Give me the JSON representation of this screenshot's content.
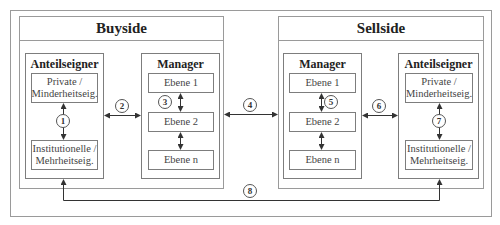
{
  "diagram": {
    "buyside": {
      "title": "Buyside",
      "shareholders": {
        "title": "Anteilseigner",
        "top_box": [
          "Private /",
          "Minderheitseig."
        ],
        "bottom_box": [
          "Institutionelle /",
          "Mehrheitseig."
        ]
      },
      "manager": {
        "title": "Manager",
        "levels": [
          "Ebene 1",
          "Ebene 2",
          "Ebene n"
        ]
      }
    },
    "sellside": {
      "title": "Sellside",
      "manager": {
        "title": "Manager",
        "levels": [
          "Ebene 1",
          "Ebene 2",
          "Ebene n"
        ]
      },
      "shareholders": {
        "title": "Anteilseigner",
        "top_box": [
          "Private /",
          "Minderheitseig."
        ],
        "bottom_box": [
          "Institutionelle /",
          "Mehrheitseig."
        ]
      }
    },
    "relations": [
      {
        "id": "1",
        "label": "1",
        "between": "Buyside Private/Minderheitseig. ↔ Institutionelle/Mehrheitseig."
      },
      {
        "id": "2",
        "label": "2",
        "between": "Buyside Anteilseigner ↔ Buyside Manager"
      },
      {
        "id": "3",
        "label": "3",
        "between": "Buyside Manager Ebene 1 ↔ Ebene 2 ↔ Ebene n"
      },
      {
        "id": "4",
        "label": "4",
        "between": "Buyside ↔ Sellside"
      },
      {
        "id": "5",
        "label": "5",
        "between": "Sellside Manager Ebene 1 ↔ Ebene 2 ↔ Ebene n"
      },
      {
        "id": "6",
        "label": "6",
        "between": "Sellside Manager ↔ Sellside Anteilseigner"
      },
      {
        "id": "7",
        "label": "7",
        "between": "Sellside Private/Minderheitseig. ↔ Institutionelle/Mehrheitseig."
      },
      {
        "id": "8",
        "label": "8",
        "between": "Buyside Anteilseigner ↔ Sellside Anteilseigner"
      }
    ],
    "colors": {
      "border": "#9a9a9a",
      "line": "#333333",
      "text": "#222222"
    }
  }
}
